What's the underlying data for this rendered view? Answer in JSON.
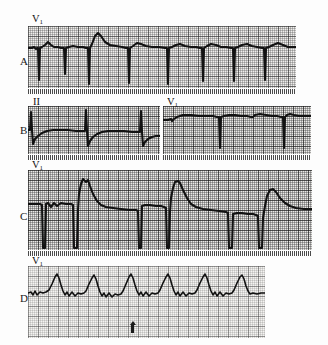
{
  "figure": {
    "type": "ecg-strip-figure",
    "background_color": "#fdfdfd",
    "trace_color": "#121212",
    "grid_color": "#2c2c2c",
    "paper_color": "#efeeec",
    "grid_small_px": 2,
    "grid_bold_px": 10
  },
  "panels": [
    {
      "label": "A",
      "strips": [
        {
          "lead_label": "V",
          "lead_sub": "1",
          "rhythm": "rS complexes with deep narrow S waves; one wider taller complex (beat 3)",
          "beats": 8
        }
      ]
    },
    {
      "label": "B",
      "strips": [
        {
          "lead_label": "II",
          "lead_sub": "",
          "rhythm": "tall narrow R spikes with slow sagging recovery",
          "beats": 3
        },
        {
          "lead_label": "V",
          "lead_sub": "1",
          "rhythm": "wide plateau QS complexes with deep downstrokes",
          "beats": 3
        }
      ]
    },
    {
      "label": "C",
      "strips": [
        {
          "lead_label": "V",
          "lead_sub": "1",
          "rhythm": "alternating narrow plateau beats and tall wide R waves with slow descent",
          "beats": 7
        }
      ]
    },
    {
      "label": "D",
      "strips": [
        {
          "lead_label": "V",
          "lead_sub": "1",
          "rhythm": "regular repeating peaked R waves with notched baseline",
          "beats": 6
        }
      ],
      "marker": {
        "name": "timing-arrow",
        "symbol": "up-arrow"
      }
    }
  ]
}
